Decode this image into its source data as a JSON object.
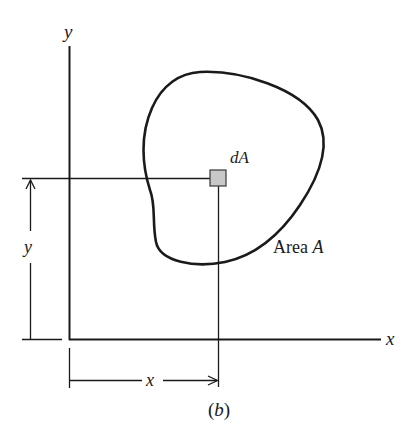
{
  "figure": {
    "caption": "(b)",
    "axes": {
      "x_label": "x",
      "y_label": "y"
    },
    "element": {
      "label": "dA",
      "fill_color": "#c8c8c8"
    },
    "region": {
      "label": "Area A",
      "label_prefix": "Area ",
      "label_symbol": "A"
    },
    "dimensions": {
      "horizontal_label": "x",
      "vertical_label": "y"
    },
    "colors": {
      "line": "#1a1a1a",
      "background": "#ffffff"
    }
  }
}
